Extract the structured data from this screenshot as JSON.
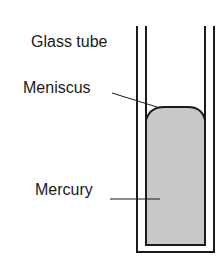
{
  "diagram": {
    "labels": {
      "glass_tube": "Glass tube",
      "meniscus": "Meniscus",
      "mercury": "Mercury"
    },
    "colors": {
      "stroke": "#1a1a1a",
      "mercury_fill": "#c8c8c8",
      "background": "#ffffff"
    }
  }
}
